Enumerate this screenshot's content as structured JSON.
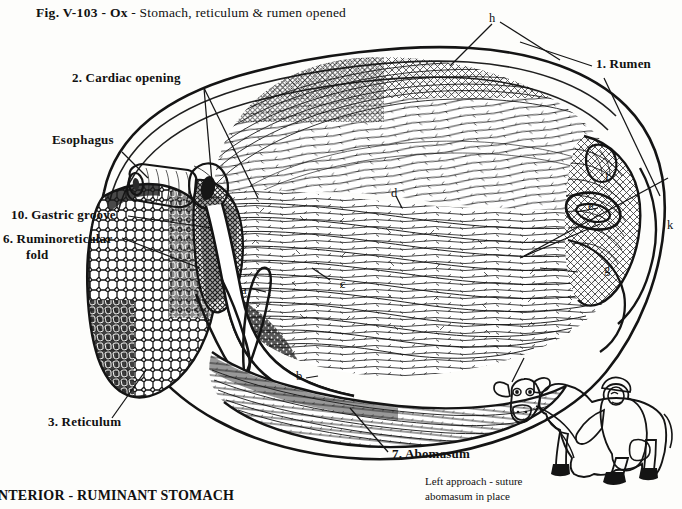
{
  "figure": {
    "title_bold": "Fig. V-103 - Ox",
    "title_regular": " - Stomach, reticulum & rumen opened",
    "bottom_caption": "NTERIOR - RUMINANT STOMACH"
  },
  "labels": {
    "cardiac_opening": "2. Cardiac opening",
    "esophagus": "Esophagus",
    "gastric_groove": "10. Gastric groove",
    "ruminoreticular_fold_line1": "6. Ruminoreticular",
    "ruminoreticular_fold_line2": "fold",
    "reticulum": "3. Reticulum",
    "abomasum": "7. Abomasum",
    "rumen": "1. Rumen"
  },
  "letters": {
    "a": "a",
    "b": "b",
    "c": "c",
    "d": "d",
    "e": "e",
    "f": "f",
    "g": "g",
    "h": "h",
    "k": "k"
  },
  "inset": {
    "caption_line1": "Left approach - suture",
    "caption_line2": "abomasum in place"
  },
  "colors": {
    "ink": "#141414",
    "background": "#fdfdfb",
    "fill_dark": "#1a1a1a",
    "fill_mid": "#5a5a5a"
  }
}
